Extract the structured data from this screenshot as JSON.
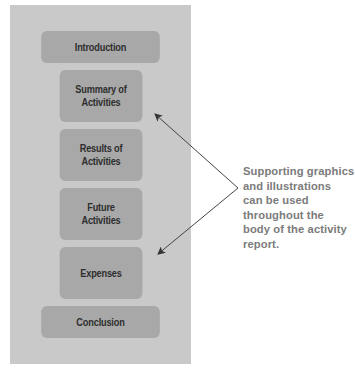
{
  "diagram": {
    "sections": [
      {
        "id": "introduction",
        "label": "Introduction"
      },
      {
        "id": "summary",
        "label": "Summary of\nActivities"
      },
      {
        "id": "results",
        "label": "Results of\nActivities"
      },
      {
        "id": "future",
        "label": "Future\nActivities"
      },
      {
        "id": "expenses",
        "label": "Expenses"
      },
      {
        "id": "conclusion",
        "label": "Conclusion"
      }
    ],
    "callout": {
      "text": "Supporting graphics\nand illustrations\ncan be used\nthroughout the\nbody of the activity\nreport.",
      "points_to": [
        "Summary of Activities",
        "Expenses"
      ]
    },
    "colors": {
      "panel": "#c9c9c9",
      "box": "#a8a8a8",
      "box_text": "#2e2e2e",
      "callout_text": "#7b7b7b",
      "arrow": "#333333"
    }
  }
}
